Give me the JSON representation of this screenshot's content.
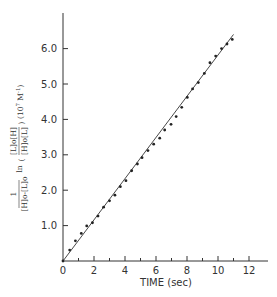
{
  "chart_data": {
    "type": "scatter",
    "title": "",
    "xlabel": "TIME (sec)",
    "ylabel": "1/([H]o-[L]o) ln(([L]o[H])/([H]o[L])) (10^7 M^-1)",
    "ylabel_parts": {
      "prefactor_num": "1",
      "prefactor_den": "[H]o-[L]o",
      "ln": "ln",
      "frac_num": "[L]o[H]",
      "frac_den": "[H]o[L]",
      "units": "(10",
      "units_exp": "7",
      "units_tail": " M",
      "units_exp2": "-1",
      "units_close": ")"
    },
    "xlim": [
      0,
      13.2
    ],
    "ylim": [
      0,
      6.9
    ],
    "x_ticks": [
      0,
      2,
      4,
      6,
      8,
      10,
      12
    ],
    "x_tick_labels": [
      "0",
      "2",
      "4",
      "6",
      "8",
      "10",
      "12"
    ],
    "x_minor_ticks": [
      1,
      3,
      5,
      7,
      9,
      11
    ],
    "y_ticks": [
      1.0,
      2.0,
      3.0,
      4.0,
      5.0,
      6.0
    ],
    "y_tick_labels": [
      "1.0",
      "2.0",
      "3.0",
      "4.0",
      "5.0",
      "6.0"
    ],
    "grid": false,
    "legend": null,
    "series": [
      {
        "name": "data points",
        "kind": "scatter",
        "x": [
          0.0,
          0.43,
          0.8,
          1.18,
          1.53,
          1.9,
          2.26,
          2.62,
          3.0,
          3.35,
          3.7,
          4.06,
          4.43,
          4.8,
          5.1,
          5.48,
          5.85,
          6.24,
          6.56,
          6.97,
          7.3,
          7.66,
          8.02,
          8.36,
          8.73,
          9.12,
          9.48,
          9.85,
          10.23,
          10.58,
          10.92
        ],
        "y": [
          0.0,
          0.31,
          0.57,
          0.78,
          0.99,
          1.08,
          1.27,
          1.52,
          1.7,
          1.86,
          2.1,
          2.27,
          2.55,
          2.74,
          2.92,
          3.12,
          3.3,
          3.47,
          3.7,
          3.86,
          4.08,
          4.34,
          4.62,
          4.86,
          5.04,
          5.3,
          5.6,
          5.79,
          6.0,
          6.13,
          6.26
        ]
      },
      {
        "name": "linear fit",
        "kind": "line",
        "x": [
          0,
          11.0
        ],
        "y": [
          0,
          6.4
        ]
      }
    ]
  }
}
